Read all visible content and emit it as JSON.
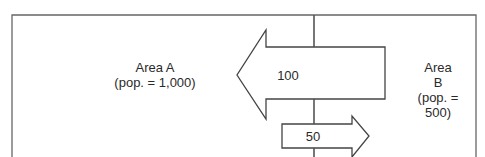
{
  "diagram": {
    "area_a": {
      "name": "Area A",
      "population": "(pop. = 1,000)"
    },
    "area_b": {
      "name_line1": "Area",
      "name_line2": "B",
      "population_line1": "(pop. =",
      "population_line2": "500)"
    },
    "flows": [
      {
        "label": "100",
        "direction": "B to A"
      },
      {
        "label": "50",
        "direction": "A to B"
      }
    ],
    "colors": {
      "line": "#555555",
      "text": "#2a2a2a",
      "background": "#ffffff"
    }
  }
}
